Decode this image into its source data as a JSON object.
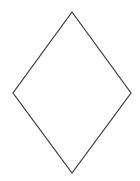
{
  "diagram": {
    "background": "#ffffff",
    "shapes": [
      {
        "type": "diamond",
        "name": "rhombus",
        "points": {
          "top": [
            72,
            12
          ],
          "right": [
            131,
            93
          ],
          "bottom": [
            72,
            173
          ],
          "left": [
            13,
            93
          ]
        },
        "stroke": "#3a3a3a",
        "stroke_width": 1.2,
        "fill": "#ffffff",
        "label": ""
      }
    ]
  }
}
